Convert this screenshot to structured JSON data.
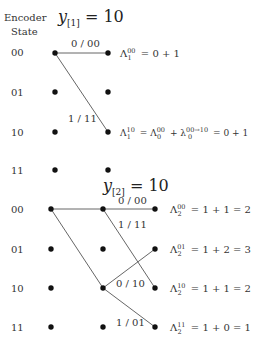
{
  "header": {
    "encoder_label_line1": "Encoder",
    "encoder_label_line2": "State"
  },
  "stage1": {
    "observation": {
      "var": "y",
      "sub": "[1]",
      "rest": " = 10"
    },
    "states": [
      "00",
      "01",
      "10",
      "11"
    ],
    "edges": [
      {
        "from": "00",
        "to": "00",
        "label": "0 / 00"
      },
      {
        "from": "00",
        "to": "10",
        "label": "1 / 11"
      }
    ],
    "metrics": [
      {
        "state": "00",
        "sup": "00",
        "sub": "1",
        "expr": " = 0 + 1"
      },
      {
        "state": "10",
        "sup": "10",
        "sub": "1",
        "expr": " = Λ",
        "sup2": "00",
        "sub2": "0",
        "expr2": " + λ",
        "sup3": "00→10",
        "sub3": "0",
        "expr3": " = 0 + 1"
      }
    ]
  },
  "stage2": {
    "observation": {
      "var": "y",
      "sub": "[2]",
      "rest": " = 10"
    },
    "states": [
      "00",
      "01",
      "10",
      "11"
    ],
    "edges": [
      {
        "from": "00",
        "to": "00",
        "label": "0 / 00"
      },
      {
        "from": "00",
        "to": "10",
        "label": "1 / 11"
      },
      {
        "from": "10",
        "to": "01",
        "label": "0 / 10"
      },
      {
        "from": "10",
        "to": "11",
        "label": "1 / 01"
      }
    ],
    "metrics": [
      {
        "state": "00",
        "sup": "00",
        "sub": "2",
        "expr": " = 1 + 1 = 2"
      },
      {
        "state": "01",
        "sup": "01",
        "sub": "2",
        "expr": " = 1 + 2 = 3"
      },
      {
        "state": "10",
        "sup": "10",
        "sub": "2",
        "expr": " = 1 + 1 = 2"
      },
      {
        "state": "11",
        "sup": "11",
        "sub": "2",
        "expr": " = 1 + 0 = 1"
      }
    ]
  }
}
